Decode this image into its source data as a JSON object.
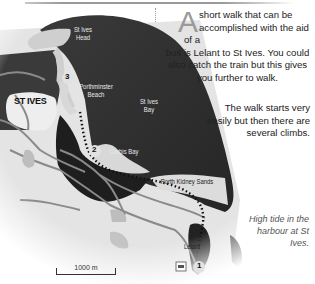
{
  "map": {
    "places": {
      "st_ives_head": "St Ives\nHead",
      "st_ives_head_l1": "St Ives",
      "st_ives_head_l2": "Head",
      "st_ives_town": "ST IVES",
      "porthminster_l1": "Porthminster",
      "porthminster_l2": "Beach",
      "st_ives_bay_l1": "St Ives",
      "st_ives_bay_l2": "Bay",
      "carbis_bay": "Carbis Bay",
      "porth_kidney": "Porth Kidney Sands",
      "lelant": "Lelant"
    },
    "waypoints": [
      "1",
      "2",
      "3"
    ],
    "scale_label": "1000 m",
    "icons": [
      "car-park-icon"
    ]
  },
  "text": {
    "intro_drop_cap": "A",
    "intro_line1": "short walk that can be",
    "intro_line2": "accomplished with the aid of a",
    "intro_rest": "bus is Lelant to St Ives. You could also catch the train but this gives you further to walk.",
    "para2": "The walk starts very easily but then there are several climbs.",
    "caption": "High tide in the harbour at St Ives."
  },
  "colors": {
    "sea": "#2b2b2b",
    "land": "#e6e6e6",
    "town": "#bdbdbd",
    "road": "#7a7a7a",
    "route": "#111111"
  }
}
